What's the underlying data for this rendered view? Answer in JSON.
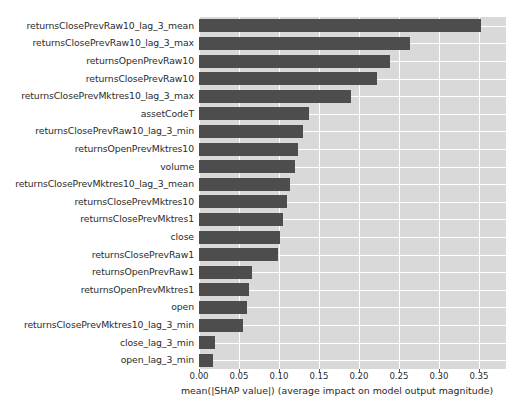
{
  "chart_data": {
    "type": "bar",
    "orientation": "horizontal",
    "title": "",
    "xlabel": "mean(|SHAP value|) (average impact on model output magnitude)",
    "ylabel": "",
    "xlim": [
      0.0,
      0.3838
    ],
    "xticks": [
      0.0,
      0.05,
      0.1,
      0.15,
      0.2,
      0.25,
      0.3,
      0.35
    ],
    "xtick_labels": [
      "0.00",
      "0.05",
      "0.10",
      "0.15",
      "0.20",
      "0.25",
      "0.30",
      "0.35"
    ],
    "grid": true,
    "legend": null,
    "bar_color": "#4d4d4d",
    "plot_background": "#d9d9d9",
    "gridline_color": "#ffffff",
    "categories": [
      "returnsClosePrevRaw10_lag_3_mean",
      "returnsClosePrevRaw10_lag_3_max",
      "returnsOpenPrevRaw10",
      "returnsClosePrevRaw10",
      "returnsClosePrevMktres10_lag_3_max",
      "assetCodeT",
      "returnsClosePrevRaw10_lag_3_min",
      "returnsOpenPrevMktres10",
      "volume",
      "returnsClosePrevMktres10_lag_3_mean",
      "returnsClosePrevMktres10",
      "returnsClosePrevMktres1",
      "close",
      "returnsClosePrevRaw1",
      "returnsOpenPrevRaw1",
      "returnsOpenPrevMktres1",
      "open",
      "returnsClosePrevMktres10_lag_3_min",
      "close_lag_3_min",
      "open_lag_3_min"
    ],
    "values": [
      0.3525,
      0.2638,
      0.2388,
      0.2225,
      0.19,
      0.1375,
      0.13,
      0.1238,
      0.12,
      0.1138,
      0.11,
      0.105,
      0.1013,
      0.0988,
      0.0663,
      0.0625,
      0.06,
      0.055,
      0.02,
      0.0175
    ]
  },
  "axis": {
    "xlabel": "mean(|SHAP value|) (average impact on model output magnitude)"
  }
}
